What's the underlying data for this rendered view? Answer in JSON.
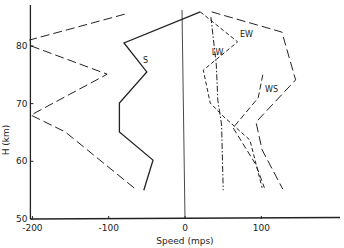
{
  "chart_data": {
    "type": "line",
    "title": "",
    "xlabel": "Speed (mps)",
    "ylabel": "H (km)",
    "xlim": [
      -200,
      200
    ],
    "ylim": [
      50,
      87
    ],
    "x_ticks": [
      -200,
      -100,
      0,
      100
    ],
    "x_tick_labels": [
      "-200",
      "-100",
      "0",
      "100"
    ],
    "y_ticks": [
      50,
      60,
      70,
      80
    ],
    "y_tick_labels": [
      "50",
      "60",
      "70",
      "80"
    ],
    "grid": false,
    "zero_line": true,
    "series": [
      {
        "name": "S",
        "style": "solid",
        "label_pos": [
          -55,
          77
        ],
        "points": [
          [
            -54,
            55.0
          ],
          [
            -42,
            60.2
          ],
          [
            -86,
            65.1
          ],
          [
            -86,
            70.1
          ],
          [
            -50,
            75.5
          ],
          [
            -80,
            80.5
          ],
          [
            20,
            85.9
          ]
        ]
      },
      {
        "name": "EW",
        "style": "short-dash",
        "label_pos": [
          72,
          81.5
        ],
        "points": [
          [
            20,
            85.9
          ],
          [
            69,
            80.7
          ],
          [
            24,
            75.8
          ],
          [
            33,
            70.1
          ],
          [
            51,
            67.7
          ],
          [
            85,
            63.7
          ],
          [
            101,
            55.4
          ]
        ]
      },
      {
        "name": "LW",
        "style": "dash-dot",
        "label_pos": [
          35,
          78.5
        ],
        "points": [
          [
            34,
            85.0
          ],
          [
            41,
            76.7
          ],
          [
            43,
            70.6
          ],
          [
            48,
            66.3
          ],
          [
            50,
            55.0
          ]
        ]
      },
      {
        "name": "WS",
        "style": "medium-dash",
        "label_pos": [
          105,
          72
        ],
        "points": [
          [
            102,
            75.0
          ],
          [
            96,
            71.0
          ],
          [
            63,
            65.8
          ],
          [
            93,
            59.4
          ],
          [
            104,
            55.4
          ]
        ]
      },
      {
        "name": "",
        "style": "long-dash",
        "points": [
          [
            35,
            85.9
          ],
          [
            127,
            82.4
          ],
          [
            145,
            74.1
          ],
          [
            93,
            66.8
          ],
          [
            101,
            62.0
          ],
          [
            128,
            55.2
          ]
        ]
      },
      {
        "name": "",
        "style": "long-dash",
        "points": [
          [
            -79,
            85.5
          ],
          [
            -204,
            81.0
          ]
        ]
      },
      {
        "name": "",
        "style": "long-dash",
        "points": [
          [
            -202,
            80.0
          ],
          [
            -102,
            75.1
          ],
          [
            -202,
            68.0
          ],
          [
            -157,
            65.1
          ],
          [
            -63,
            55.0
          ]
        ]
      }
    ]
  }
}
